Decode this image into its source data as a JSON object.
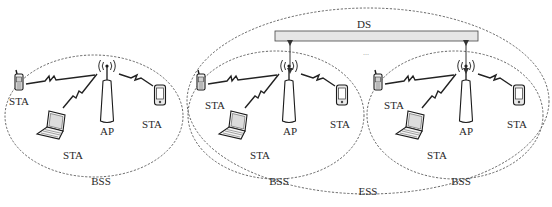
{
  "figure": {
    "title_labels": {
      "ds": "DS",
      "ess": "ESS",
      "ellipsis": "..."
    },
    "colors": {
      "line": "#555555",
      "ds_fill": "#e6e6e6",
      "ds_stroke": "#444444",
      "text": "#2a2a2a"
    },
    "bss_groups": [
      {
        "id": "bss-1",
        "label": "BSS",
        "ap_label": "AP",
        "stations": [
          {
            "type": "phone",
            "label": "STA"
          },
          {
            "type": "laptop",
            "label": "STA"
          },
          {
            "type": "pda",
            "label": "STA"
          }
        ],
        "connected_to_ds": false
      },
      {
        "id": "bss-2",
        "label": "BSS",
        "ap_label": "AP",
        "stations": [
          {
            "type": "phone",
            "label": "STA"
          },
          {
            "type": "laptop",
            "label": "STA"
          },
          {
            "type": "pda",
            "label": "STA"
          }
        ],
        "connected_to_ds": true
      },
      {
        "id": "bss-3",
        "label": "BSS",
        "ap_label": "AP",
        "stations": [
          {
            "type": "phone",
            "label": "STA"
          },
          {
            "type": "laptop",
            "label": "STA"
          },
          {
            "type": "pda",
            "label": "STA"
          }
        ],
        "connected_to_ds": true
      }
    ]
  }
}
